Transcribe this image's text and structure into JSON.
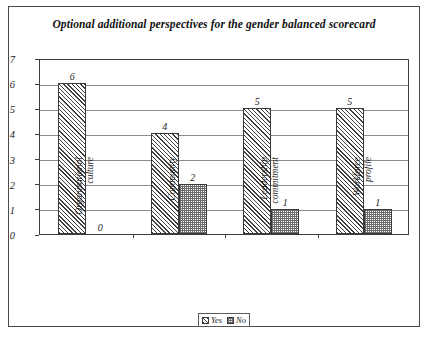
{
  "figure": {
    "title": "Optional additional perspectives for the gender balanced scorecard",
    "caption_partial": ""
  },
  "legend": {
    "yes_label": "Yes",
    "no_label": "No"
  },
  "axis": {
    "yticks": [
      "0",
      "1",
      "2",
      "3",
      "4",
      "5",
      "6",
      "7"
    ]
  },
  "categories": [
    {
      "line1": "Organisational",
      "line2": "culture"
    },
    {
      "line1": "Community",
      "line2": ""
    },
    {
      "line1": "Leadership",
      "line2": "commitment"
    },
    {
      "line1": "Workforce",
      "line2": "profile"
    }
  ],
  "bar_values": {
    "yes": [
      "6",
      "4",
      "5",
      "5"
    ],
    "no": [
      "0",
      "2",
      "1",
      "1"
    ]
  },
  "chart_data": {
    "type": "bar",
    "title": "Optional additional perspectives for the gender balanced scorecard",
    "categories": [
      "Organisational culture",
      "Community",
      "Leadership commitment",
      "Workforce profile"
    ],
    "series": [
      {
        "name": "Yes",
        "values": [
          6,
          4,
          5,
          5
        ]
      },
      {
        "name": "No",
        "values": [
          0,
          2,
          1,
          1
        ]
      }
    ],
    "xlabel": "",
    "ylabel": "",
    "ylim": [
      0,
      7
    ],
    "ytick_step": 1,
    "grid": true,
    "legend_position": "bottom",
    "data_labels": true
  }
}
